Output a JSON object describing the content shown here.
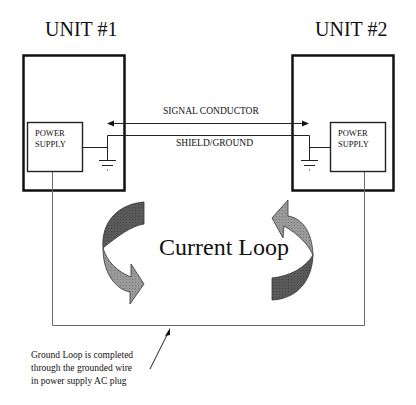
{
  "units": [
    {
      "title": "UNIT #1",
      "power_supply": [
        "POWER",
        "SUPPLY"
      ]
    },
    {
      "title": "UNIT #2",
      "power_supply": [
        "POWER",
        "SUPPLY"
      ]
    }
  ],
  "connections": {
    "signal_label": "SIGNAL CONDUCTOR",
    "shield_label": "SHIELD/GROUND"
  },
  "loop_label": "Current Loop",
  "annotation": {
    "lines": [
      "Ground Loop is completed",
      "through the grounded wire",
      "in power supply AC plug"
    ]
  },
  "colors": {
    "line": "#111111",
    "arrow_dark": "#555555",
    "arrow_light": "#9a9a9a",
    "wire": "#666666"
  }
}
